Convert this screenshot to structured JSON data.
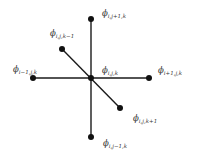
{
  "diagram": {
    "title": "",
    "type": "3D seven-point finite-difference stencil",
    "colors": {
      "line": "#1a1a1a",
      "node": "#111111",
      "text": "#333333",
      "background": "#ffffff"
    },
    "nodes": [
      {
        "id": "center",
        "x": 91,
        "y": 78,
        "symbol": "ϕ",
        "subscript": "i,j,k",
        "label_x": 102,
        "label_y": 73
      },
      {
        "id": "up",
        "x": 91,
        "y": 19,
        "symbol": "ϕ",
        "subscript": "i,j+1,k",
        "label_x": 102,
        "label_y": 16
      },
      {
        "id": "down",
        "x": 91,
        "y": 137,
        "symbol": "ϕ",
        "subscript": "i,j−1,k",
        "label_x": 103,
        "label_y": 146
      },
      {
        "id": "left",
        "x": 33,
        "y": 78,
        "symbol": "ϕ",
        "subscript": "i−1,j,k",
        "label_x": 13,
        "label_y": 72
      },
      {
        "id": "right",
        "x": 149,
        "y": 78,
        "symbol": "ϕ",
        "subscript": "i+1,j,k",
        "label_x": 158,
        "label_y": 73
      },
      {
        "id": "back",
        "x": 62,
        "y": 49,
        "symbol": "ϕ",
        "subscript": "i,j,k−1",
        "label_x": 50,
        "label_y": 36
      },
      {
        "id": "front",
        "x": 120,
        "y": 108,
        "symbol": "ϕ",
        "subscript": "i,j,k+1",
        "label_x": 133,
        "label_y": 121
      }
    ],
    "edges": [
      {
        "from": "up",
        "to": "down"
      },
      {
        "from": "left",
        "to": "right"
      },
      {
        "from": "back",
        "to": "front"
      }
    ]
  }
}
